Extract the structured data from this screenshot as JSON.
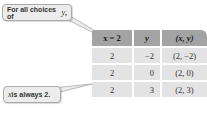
{
  "callouts": {
    "top": {
      "text": "For all choices of ",
      "var": "y",
      "suffix": ","
    },
    "bottom": {
      "var": "x",
      "text": " is always 2."
    }
  },
  "table": {
    "headers": {
      "x": "x = 2",
      "y": "y",
      "xy": "(x, y)"
    },
    "rows": [
      {
        "x": "2",
        "y": "−2",
        "xy": "(2, −2)"
      },
      {
        "x": "2",
        "y": "0",
        "xy": "(2, 0)"
      },
      {
        "x": "2",
        "y": "3",
        "xy": "(2, 3)"
      }
    ]
  }
}
